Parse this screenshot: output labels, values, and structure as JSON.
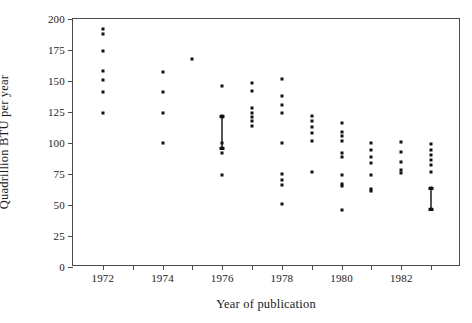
{
  "chart_data": {
    "type": "scatter",
    "title": "",
    "xlabel": "Year of publication",
    "ylabel": "Quadrillion BTU per year",
    "xlim": [
      1971,
      1984
    ],
    "ylim": [
      0,
      200
    ],
    "grid": false,
    "legend": "none",
    "xticks": [
      1971,
      1972,
      1973,
      1974,
      1975,
      1976,
      1977,
      1978,
      1979,
      1980,
      1981,
      1982,
      1983,
      1984
    ],
    "xtick_labels": [
      "",
      "1972",
      "",
      "1974",
      "",
      "1976",
      "",
      "1978",
      "",
      "1980",
      "",
      "1982",
      "",
      ""
    ],
    "yticks": [
      0,
      25,
      50,
      75,
      100,
      125,
      150,
      175,
      200
    ],
    "ytick_labels": [
      "0",
      "25",
      "50",
      "75",
      "100",
      "125",
      "150",
      "175",
      "200"
    ],
    "series": [
      {
        "name": "forecasts",
        "marker": "square-dot",
        "points": [
          {
            "x": 1972,
            "y": 192
          },
          {
            "x": 1972,
            "y": 188
          },
          {
            "x": 1972,
            "y": 174
          },
          {
            "x": 1972,
            "y": 158
          },
          {
            "x": 1972,
            "y": 151
          },
          {
            "x": 1972,
            "y": 141
          },
          {
            "x": 1972,
            "y": 124
          },
          {
            "x": 1974,
            "y": 157
          },
          {
            "x": 1974,
            "y": 141
          },
          {
            "x": 1974,
            "y": 124
          },
          {
            "x": 1974,
            "y": 100
          },
          {
            "x": 1975,
            "y": 168
          },
          {
            "x": 1976,
            "y": 146
          },
          {
            "x": 1976,
            "y": 122
          },
          {
            "x": 1976,
            "y": 121
          },
          {
            "x": 1976,
            "y": 100
          },
          {
            "x": 1976,
            "y": 96
          },
          {
            "x": 1976,
            "y": 92
          },
          {
            "x": 1976,
            "y": 74
          },
          {
            "x": 1977,
            "y": 148
          },
          {
            "x": 1977,
            "y": 142
          },
          {
            "x": 1977,
            "y": 128
          },
          {
            "x": 1977,
            "y": 124
          },
          {
            "x": 1977,
            "y": 121
          },
          {
            "x": 1977,
            "y": 118
          },
          {
            "x": 1977,
            "y": 114
          },
          {
            "x": 1978,
            "y": 152
          },
          {
            "x": 1978,
            "y": 138
          },
          {
            "x": 1978,
            "y": 131
          },
          {
            "x": 1978,
            "y": 124
          },
          {
            "x": 1978,
            "y": 100
          },
          {
            "x": 1978,
            "y": 75
          },
          {
            "x": 1978,
            "y": 70
          },
          {
            "x": 1978,
            "y": 66
          },
          {
            "x": 1978,
            "y": 51
          },
          {
            "x": 1979,
            "y": 122
          },
          {
            "x": 1979,
            "y": 118
          },
          {
            "x": 1979,
            "y": 113
          },
          {
            "x": 1979,
            "y": 108
          },
          {
            "x": 1979,
            "y": 102
          },
          {
            "x": 1979,
            "y": 77
          },
          {
            "x": 1980,
            "y": 116
          },
          {
            "x": 1980,
            "y": 109
          },
          {
            "x": 1980,
            "y": 106
          },
          {
            "x": 1980,
            "y": 102
          },
          {
            "x": 1980,
            "y": 92
          },
          {
            "x": 1980,
            "y": 89
          },
          {
            "x": 1980,
            "y": 74
          },
          {
            "x": 1980,
            "y": 67
          },
          {
            "x": 1980,
            "y": 65
          },
          {
            "x": 1980,
            "y": 46
          },
          {
            "x": 1981,
            "y": 100
          },
          {
            "x": 1981,
            "y": 94
          },
          {
            "x": 1981,
            "y": 89
          },
          {
            "x": 1981,
            "y": 84
          },
          {
            "x": 1981,
            "y": 74
          },
          {
            "x": 1981,
            "y": 63
          },
          {
            "x": 1981,
            "y": 61
          },
          {
            "x": 1982,
            "y": 101
          },
          {
            "x": 1982,
            "y": 93
          },
          {
            "x": 1982,
            "y": 85
          },
          {
            "x": 1982,
            "y": 78
          },
          {
            "x": 1982,
            "y": 76
          },
          {
            "x": 1983,
            "y": 99
          },
          {
            "x": 1983,
            "y": 94
          },
          {
            "x": 1983,
            "y": 90
          },
          {
            "x": 1983,
            "y": 86
          },
          {
            "x": 1983,
            "y": 82
          },
          {
            "x": 1983,
            "y": 77
          },
          {
            "x": 1983,
            "y": 64
          },
          {
            "x": 1983,
            "y": 47
          }
        ]
      }
    ],
    "range_bars": [
      {
        "x": 1976,
        "y_low": 96,
        "y_high": 122
      },
      {
        "x": 1983,
        "y_low": 47,
        "y_high": 64
      }
    ]
  },
  "axis_titles": {
    "x": "Year of publication",
    "y": "Quadrillion BTU per year"
  },
  "colors": {
    "marker": "#111111",
    "axis": "#4a4a4a",
    "background": "#ffffff"
  }
}
